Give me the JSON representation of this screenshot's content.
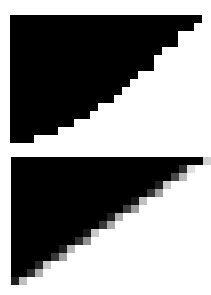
{
  "colors": {
    "background": "#ffffff",
    "fill": "#000000"
  },
  "panels": [
    {
      "name": "aliased-triangle",
      "x": 10,
      "y": 15,
      "cell": 8,
      "cols": 24,
      "rows": 16,
      "antialiased": false,
      "row_fill_cols": [
        24,
        23,
        21,
        21,
        19,
        18,
        18,
        16,
        15,
        14,
        13,
        11,
        10,
        8,
        6,
        3
      ]
    },
    {
      "name": "antialiased-triangle",
      "x": 11,
      "y": 157,
      "cell": 8,
      "cols": 24,
      "rows": 16,
      "antialiased": true,
      "row_fill_cols": [
        24,
        22,
        21,
        19,
        18,
        16,
        15,
        13,
        12,
        10,
        9,
        7,
        6,
        4,
        3,
        1
      ],
      "edge_grays": [
        [
          "#d0d0d0"
        ],
        [
          "#303030",
          "#e0e0e0"
        ],
        [
          "#484848",
          "#b8b8b8"
        ],
        [
          "#202020",
          "#c8c8c8"
        ],
        [
          "#383838",
          "#a0a0a0"
        ],
        [
          "#181818",
          "#c0c0c0"
        ],
        [
          "#404040",
          "#9c9c9c"
        ],
        [
          "#202020",
          "#b0b0b0"
        ],
        [
          "#383838",
          "#a8a8a8"
        ],
        [
          "#181818",
          "#c8c8c8"
        ],
        [
          "#303030",
          "#909090"
        ],
        [
          "#202020",
          "#b8b8b8"
        ],
        [
          "#383838",
          "#a0a0a0"
        ],
        [
          "#282828",
          "#c8c8c8"
        ],
        [
          "#303030",
          "#b0b0b0"
        ],
        [
          "#202020",
          "#c0c0c0"
        ]
      ]
    }
  ]
}
